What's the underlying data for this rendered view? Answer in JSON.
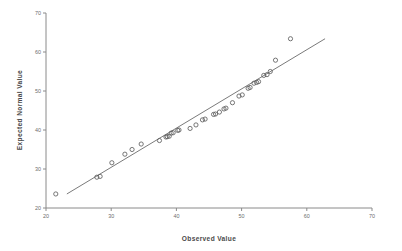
{
  "chart_data": {
    "type": "scatter",
    "title": "",
    "xlabel": "Observed Value",
    "ylabel": "Expected Normal Value",
    "xlim": [
      20,
      70
    ],
    "ylim": [
      20,
      70
    ],
    "xticks": [
      20,
      30,
      40,
      50,
      60,
      70
    ],
    "yticks": [
      20,
      30,
      40,
      50,
      60,
      70
    ],
    "xtick_labels": [
      "20",
      "30",
      "40",
      "50",
      "60",
      "70"
    ],
    "ytick_labels": [
      "20",
      "30",
      "40",
      "50",
      "60",
      "70"
    ],
    "grid": false,
    "legend": false,
    "marker": "open-circle",
    "point_color": "#5e5e5e",
    "line_color": "#6b6b6b",
    "axis_color": "#8a8a8a",
    "reference_line": {
      "x": [
        23.2,
        62.8
      ],
      "y": [
        23.6,
        63.4
      ]
    },
    "points": [
      {
        "x": 21.5,
        "y": 23.6
      },
      {
        "x": 27.8,
        "y": 27.9
      },
      {
        "x": 28.3,
        "y": 28.1
      },
      {
        "x": 30.1,
        "y": 31.6
      },
      {
        "x": 32.1,
        "y": 33.8
      },
      {
        "x": 33.2,
        "y": 35.0
      },
      {
        "x": 34.6,
        "y": 36.4
      },
      {
        "x": 37.4,
        "y": 37.3
      },
      {
        "x": 38.4,
        "y": 38.2
      },
      {
        "x": 38.6,
        "y": 38.3
      },
      {
        "x": 38.9,
        "y": 38.4
      },
      {
        "x": 39.2,
        "y": 39.2
      },
      {
        "x": 39.5,
        "y": 39.3
      },
      {
        "x": 40.2,
        "y": 39.9
      },
      {
        "x": 40.4,
        "y": 40.0
      },
      {
        "x": 42.1,
        "y": 40.4
      },
      {
        "x": 43.0,
        "y": 41.3
      },
      {
        "x": 44.0,
        "y": 42.6
      },
      {
        "x": 44.4,
        "y": 42.8
      },
      {
        "x": 45.7,
        "y": 44.0
      },
      {
        "x": 46.0,
        "y": 44.1
      },
      {
        "x": 46.6,
        "y": 44.6
      },
      {
        "x": 47.3,
        "y": 45.4
      },
      {
        "x": 47.6,
        "y": 45.6
      },
      {
        "x": 48.6,
        "y": 47.0
      },
      {
        "x": 49.6,
        "y": 48.7
      },
      {
        "x": 50.1,
        "y": 49.0
      },
      {
        "x": 51.0,
        "y": 50.7
      },
      {
        "x": 51.3,
        "y": 50.9
      },
      {
        "x": 51.9,
        "y": 52.0
      },
      {
        "x": 52.3,
        "y": 52.2
      },
      {
        "x": 52.6,
        "y": 52.4
      },
      {
        "x": 53.4,
        "y": 54.0
      },
      {
        "x": 53.9,
        "y": 54.2
      },
      {
        "x": 54.4,
        "y": 55.0
      },
      {
        "x": 55.2,
        "y": 57.9
      },
      {
        "x": 57.5,
        "y": 63.4
      }
    ]
  }
}
